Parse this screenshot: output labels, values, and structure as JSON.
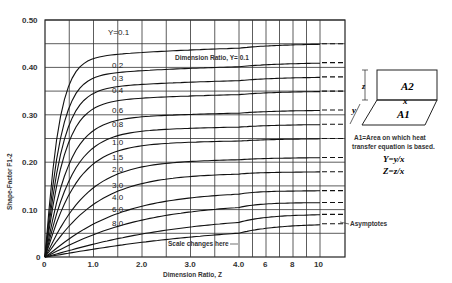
{
  "chart_data": {
    "type": "line",
    "title": "",
    "xlabel": "Dimension Ratio, Z",
    "ylabel": "Shape-Factor F1-2",
    "ylim": [
      0,
      0.5
    ],
    "xlim": [
      0,
      10
    ],
    "x_ticks": [
      "0",
      "1.0",
      "2.0",
      "3.0",
      "4.0",
      "6",
      "8",
      "10"
    ],
    "y_ticks": [
      "0",
      "0.10",
      "0.20",
      "0.30",
      "0.40",
      "0.50"
    ],
    "grid": true,
    "x_scale_note": "Scale changes here",
    "series_label_prefix": "Y=",
    "in_plot_label": "Dimension Ratio, Y= 0.1",
    "asymptote_label": "Asymptotes",
    "series": [
      {
        "name": "0.1",
        "asymptote": 0.45,
        "values_at": {
          "0.5": 0.4,
          "1.0": 0.43,
          "2.0": 0.44,
          "4.0": 0.445,
          "10": 0.45
        }
      },
      {
        "name": "0.2",
        "asymptote": 0.41,
        "values_at": {
          "0.5": 0.34,
          "1.0": 0.38,
          "2.0": 0.395,
          "4.0": 0.4,
          "10": 0.405
        }
      },
      {
        "name": "0.3",
        "asymptote": 0.38,
        "values_at": {
          "0.5": 0.3,
          "1.0": 0.35,
          "2.0": 0.365,
          "4.0": 0.37,
          "10": 0.375
        }
      },
      {
        "name": "0.4",
        "asymptote": 0.35,
        "values_at": {
          "0.5": 0.27,
          "1.0": 0.32,
          "2.0": 0.335,
          "4.0": 0.345,
          "10": 0.35
        }
      },
      {
        "name": "0.6",
        "asymptote": 0.31,
        "values_at": {
          "0.5": 0.22,
          "1.0": 0.27,
          "2.0": 0.29,
          "4.0": 0.3,
          "10": 0.305
        }
      },
      {
        "name": "0.8",
        "asymptote": 0.28,
        "values_at": {
          "0.5": 0.18,
          "1.0": 0.24,
          "2.0": 0.26,
          "4.0": 0.27,
          "10": 0.28
        }
      },
      {
        "name": "1.0",
        "asymptote": 0.25,
        "values_at": {
          "0.5": 0.16,
          "1.0": 0.21,
          "2.0": 0.235,
          "4.0": 0.245,
          "10": 0.25
        }
      },
      {
        "name": "1.5",
        "asymptote": 0.21,
        "values_at": {
          "0.5": 0.12,
          "1.0": 0.16,
          "2.0": 0.19,
          "4.0": 0.205,
          "10": 0.21
        }
      },
      {
        "name": "2.0",
        "asymptote": 0.18,
        "values_at": {
          "0.5": 0.1,
          "1.0": 0.14,
          "2.0": 0.16,
          "4.0": 0.175,
          "10": 0.18
        }
      },
      {
        "name": "3.0",
        "asymptote": 0.14,
        "values_at": {
          "0.5": 0.07,
          "1.0": 0.1,
          "2.0": 0.12,
          "4.0": 0.135,
          "10": 0.14
        }
      },
      {
        "name": "4.0",
        "asymptote": 0.115,
        "values_at": {
          "0.5": 0.055,
          "1.0": 0.08,
          "2.0": 0.1,
          "4.0": 0.11,
          "10": 0.115
        }
      },
      {
        "name": "6.0",
        "asymptote": 0.09,
        "values_at": {
          "0.5": 0.04,
          "1.0": 0.06,
          "2.0": 0.075,
          "4.0": 0.085,
          "10": 0.09
        }
      },
      {
        "name": "8.0",
        "asymptote": 0.07,
        "values_at": {
          "0.5": 0.03,
          "1.0": 0.045,
          "2.0": 0.06,
          "4.0": 0.065,
          "10": 0.07
        }
      }
    ]
  },
  "diagram": {
    "a2_label": "A2",
    "a1_label": "A1",
    "x_label": "x",
    "y_label": "y",
    "z_label": "z",
    "note_line1": "A1=Area on which heat",
    "note_line2": "transfer equation is based.",
    "eq_y": "Y=y/x",
    "eq_z": "Z=z/x"
  }
}
